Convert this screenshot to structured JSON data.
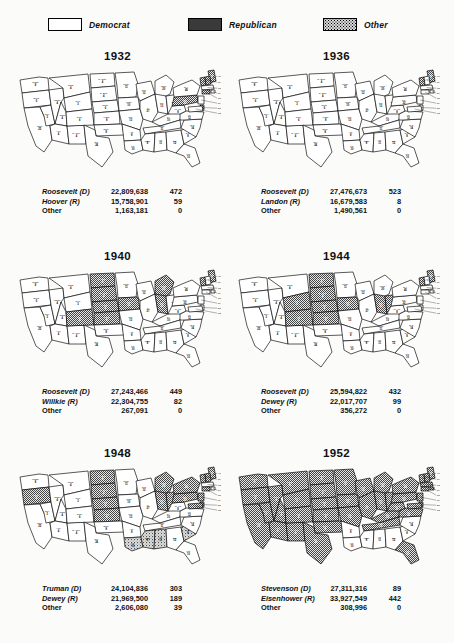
{
  "legend": {
    "items": [
      {
        "label": "Democrat",
        "pattern": "white",
        "icon": "legend-swatch-democrat"
      },
      {
        "label": "Republican",
        "pattern": "dark-stipple",
        "icon": "legend-swatch-republican"
      },
      {
        "label": "Other",
        "pattern": "light-stipple",
        "icon": "legend-swatch-other"
      }
    ]
  },
  "chart_data": {
    "type": "map",
    "legend": [
      "Democrat",
      "Republican",
      "Other"
    ],
    "columns": [
      "Candidate",
      "Popular Vote",
      "Electoral Vote"
    ],
    "elections": [
      {
        "year": "1932",
        "rows": [
          {
            "candidate": "Roosevelt (D)",
            "votes": "22,809,638",
            "ev": "472"
          },
          {
            "candidate": "Hoover (R)",
            "votes": "15,758,901",
            "ev": "59"
          },
          {
            "candidate": "Other",
            "votes": "1,163,181",
            "ev": "0"
          }
        ],
        "republican_states": [
          "ME",
          "NH",
          "VT",
          "PA",
          "CT",
          "DE"
        ],
        "other_states": []
      },
      {
        "year": "1936",
        "rows": [
          {
            "candidate": "Roosevelt (D)",
            "votes": "27,476,673",
            "ev": "523"
          },
          {
            "candidate": "Landon (R)",
            "votes": "16,679,583",
            "ev": "8"
          },
          {
            "candidate": "Other",
            "votes": "1,490,561",
            "ev": "0"
          }
        ],
        "republican_states": [
          "ME",
          "VT"
        ],
        "other_states": []
      },
      {
        "year": "1940",
        "rows": [
          {
            "candidate": "Roosevelt (D)",
            "votes": "27,243,466",
            "ev": "449"
          },
          {
            "candidate": "Willkie (R)",
            "votes": "22,304,755",
            "ev": "82"
          },
          {
            "candidate": "Other",
            "votes": "267,091",
            "ev": "0"
          }
        ],
        "republican_states": [
          "ND",
          "SD",
          "NE",
          "KS",
          "CO",
          "IA",
          "MI",
          "IN",
          "ME",
          "VT"
        ],
        "other_states": []
      },
      {
        "year": "1944",
        "rows": [
          {
            "candidate": "Roosevelt (D)",
            "votes": "25,594,822",
            "ev": "432"
          },
          {
            "candidate": "Dewey (R)",
            "votes": "22,017,707",
            "ev": "99"
          },
          {
            "candidate": "Other",
            "votes": "356,272",
            "ev": "0"
          }
        ],
        "republican_states": [
          "ND",
          "SD",
          "NE",
          "KS",
          "CO",
          "WY",
          "IA",
          "IN",
          "OH",
          "ME",
          "VT"
        ],
        "other_states": []
      },
      {
        "year": "1948",
        "rows": [
          {
            "candidate": "Truman (D)",
            "votes": "24,104,836",
            "ev": "303"
          },
          {
            "candidate": "Dewey (R)",
            "votes": "21,969,500",
            "ev": "189"
          },
          {
            "candidate": "Other",
            "votes": "2,606,080",
            "ev": "39"
          }
        ],
        "republican_states": [
          "OR",
          "ND",
          "SD",
          "NE",
          "KS",
          "MI",
          "IN",
          "OH",
          "PA",
          "NY",
          "NJ",
          "CT",
          "VT",
          "NH",
          "ME",
          "MD",
          "DE"
        ],
        "other_states": [
          "LA",
          "MS",
          "AL",
          "SC"
        ]
      },
      {
        "year": "1952",
        "rows": [
          {
            "candidate": "Stevenson (D)",
            "votes": "27,311,316",
            "ev": "89"
          },
          {
            "candidate": "Eisenhower (R)",
            "votes": "33,927,549",
            "ev": "442"
          },
          {
            "candidate": "Other",
            "votes": "308,996",
            "ev": "0"
          }
        ],
        "republican_states": [
          "WA",
          "OR",
          "CA",
          "NV",
          "ID",
          "MT",
          "WY",
          "UT",
          "AZ",
          "NM",
          "CO",
          "ND",
          "SD",
          "NE",
          "KS",
          "OK",
          "TX",
          "MN",
          "IA",
          "MO",
          "WI",
          "IL",
          "MI",
          "IN",
          "OH",
          "KY",
          "TN",
          "VA",
          "WV",
          "PA",
          "NY",
          "NJ",
          "CT",
          "RI",
          "MA",
          "VT",
          "NH",
          "ME",
          "MD",
          "DE",
          "FL"
        ],
        "other_states": []
      }
    ]
  },
  "states": {
    "WA": {
      "name": "Wash.",
      "ev": "8"
    },
    "OR": {
      "name": "Oreg.",
      "ev": "6"
    },
    "CA": {
      "name": "Calif.",
      "ev": "25"
    },
    "NV": {
      "name": "Nev.",
      "ev": "3"
    },
    "ID": {
      "name": "Idaho",
      "ev": "4"
    },
    "MT": {
      "name": "Mont.",
      "ev": "4"
    },
    "WY": {
      "name": "Wyo.",
      "ev": "3"
    },
    "UT": {
      "name": "Utah",
      "ev": "4"
    },
    "AZ": {
      "name": "Ariz.",
      "ev": "4"
    },
    "NM": {
      "name": "N. Mex.",
      "ev": "4"
    },
    "CO": {
      "name": "Colo.",
      "ev": "6"
    },
    "ND": {
      "name": "N. Dak.",
      "ev": "4"
    },
    "SD": {
      "name": "S. Dak.",
      "ev": "4"
    },
    "NE": {
      "name": "Nebr.",
      "ev": "6"
    },
    "KS": {
      "name": "Kans.",
      "ev": "8"
    },
    "OK": {
      "name": "Okla.",
      "ev": "8"
    },
    "TX": {
      "name": "Tex.",
      "ev": "24"
    },
    "MN": {
      "name": "Minn.",
      "ev": "11"
    },
    "IA": {
      "name": "Iowa",
      "ev": "10"
    },
    "MO": {
      "name": "Mo.",
      "ev": "13"
    },
    "AR": {
      "name": "Ark.",
      "ev": "8"
    },
    "LA": {
      "name": "La.",
      "ev": "10"
    },
    "WI": {
      "name": "Wis.",
      "ev": "12"
    },
    "IL": {
      "name": "Ill.",
      "ev": "27"
    },
    "MI": {
      "name": "Mich.",
      "ev": "20"
    },
    "IN": {
      "name": "Ind.",
      "ev": "13"
    },
    "OH": {
      "name": "Ohio",
      "ev": "25"
    },
    "KY": {
      "name": "Ky.",
      "ev": "10"
    },
    "TN": {
      "name": "Tenn.",
      "ev": "11"
    },
    "MS": {
      "name": "Miss.",
      "ev": "8"
    },
    "AL": {
      "name": "Ala.",
      "ev": "11"
    },
    "GA": {
      "name": "Ga.",
      "ev": "12"
    },
    "FL": {
      "name": "Fla.",
      "ev": "10"
    },
    "SC": {
      "name": "S.C.",
      "ev": "8"
    },
    "NC": {
      "name": "N.C.",
      "ev": "14"
    },
    "VA": {
      "name": "Va.",
      "ev": "12"
    },
    "WV": {
      "name": "W. Va.",
      "ev": "8"
    },
    "PA": {
      "name": "Pa.",
      "ev": "32"
    },
    "NY": {
      "name": "N.Y.",
      "ev": "45"
    },
    "ME": {
      "name": "Me.",
      "ev": "5"
    },
    "VT": {
      "name": "Vt.",
      "ev": "3"
    },
    "NH": {
      "name": "N.H.",
      "ev": "4"
    },
    "MA": {
      "name": "Mass.",
      "ev": "16"
    },
    "RI": {
      "name": "R.I.",
      "ev": "4"
    },
    "CT": {
      "name": "Conn.",
      "ev": "8"
    },
    "NJ": {
      "name": "N.J.",
      "ev": "16"
    },
    "DE": {
      "name": "Del.",
      "ev": "3"
    },
    "MD": {
      "name": "Md.",
      "ev": "8"
    }
  }
}
